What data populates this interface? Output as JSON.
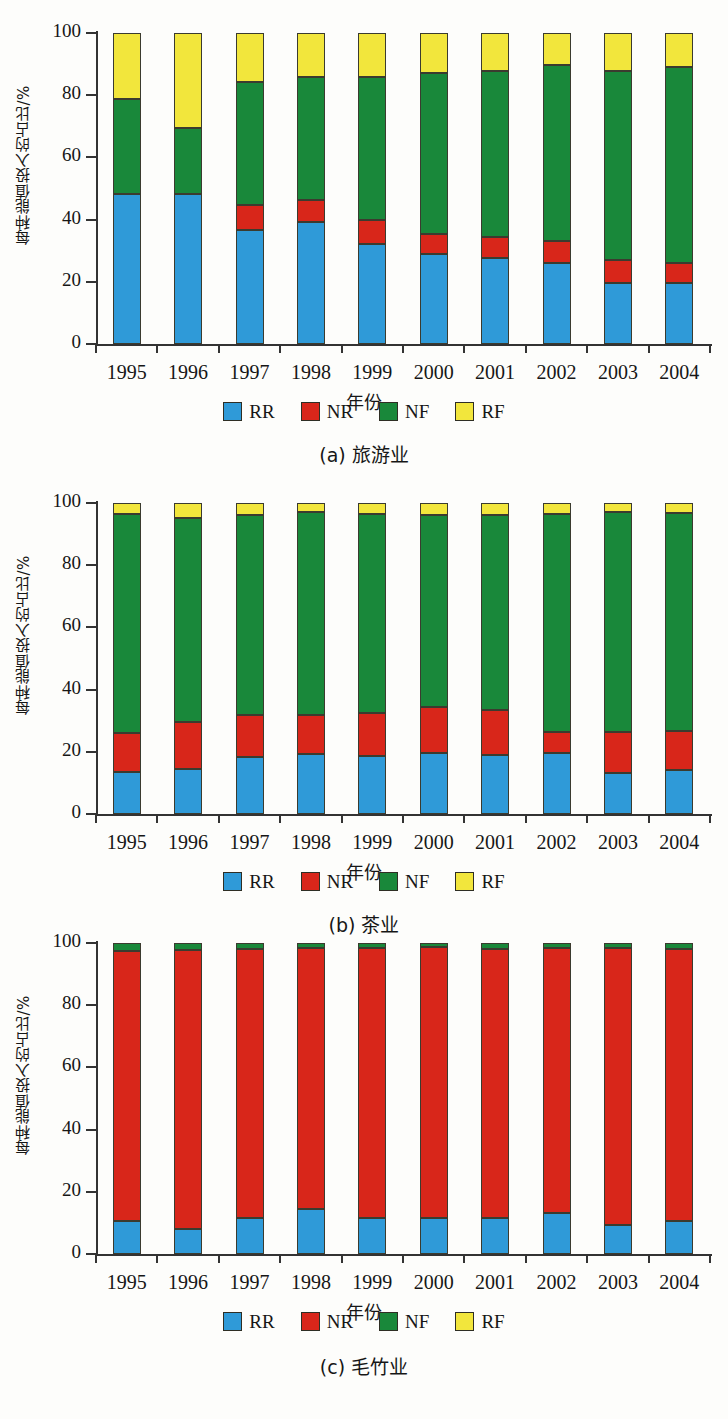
{
  "figure": {
    "y_axis_label": "每种能值投入的占比/%",
    "x_axis_label": "年份",
    "y_ticks": [
      "0",
      "20",
      "40",
      "60",
      "80",
      "100"
    ],
    "years": [
      "1995",
      "1996",
      "1997",
      "1998",
      "1999",
      "2000",
      "2001",
      "2002",
      "2003",
      "2004"
    ],
    "legend": [
      {
        "label": "RR",
        "color": "#2f9ad8",
        "icon": "blue-square-swatch"
      },
      {
        "label": "NR",
        "color": "#d8261a",
        "icon": "red-square-swatch"
      },
      {
        "label": "NF",
        "color": "#19883a",
        "icon": "green-square-swatch"
      },
      {
        "label": "RF",
        "color": "#f2e63c",
        "icon": "yellow-square-swatch"
      }
    ],
    "captions": {
      "a": "(a) 旅游业",
      "b": "(b) 茶业",
      "c": "(c) 毛竹业"
    }
  },
  "chart_data": [
    {
      "id": "a",
      "type": "bar",
      "stacked": true,
      "title": "(a) 旅游业",
      "xlabel": "年份",
      "ylabel": "每种能值投入的占比/%",
      "ylim": [
        0,
        100
      ],
      "yticks": [
        0,
        20,
        40,
        60,
        80,
        100
      ],
      "grid": false,
      "legend_position": "below-axes",
      "categories": [
        "1995",
        "1996",
        "1997",
        "1998",
        "1999",
        "2000",
        "2001",
        "2002",
        "2003",
        "2004"
      ],
      "series": [
        {
          "name": "RR",
          "color": "#2f9ad8",
          "values": [
            48.3,
            48.3,
            36.8,
            39.2,
            32.2,
            28.9,
            27.7,
            26.2,
            19.5,
            19.5
          ]
        },
        {
          "name": "NR",
          "color": "#d8261a",
          "values": [
            0.0,
            0.0,
            7.8,
            7.1,
            7.6,
            6.5,
            6.6,
            6.9,
            7.6,
            6.4
          ]
        },
        {
          "name": "NF",
          "color": "#19883a",
          "values": [
            30.6,
            21.2,
            39.5,
            39.7,
            46.1,
            51.9,
            53.5,
            56.6,
            60.8,
            63.1
          ]
        },
        {
          "name": "RF",
          "color": "#f2e63c",
          "values": [
            21.1,
            30.5,
            15.9,
            14.0,
            14.1,
            12.7,
            12.2,
            10.3,
            12.1,
            11.0
          ]
        }
      ]
    },
    {
      "id": "b",
      "type": "bar",
      "stacked": true,
      "title": "(b) 茶业",
      "xlabel": "年份",
      "ylabel": "每种能值投入的占比/%",
      "ylim": [
        0,
        100
      ],
      "yticks": [
        0,
        20,
        40,
        60,
        80,
        100
      ],
      "grid": false,
      "legend_position": "below-axes",
      "categories": [
        "1995",
        "1996",
        "1997",
        "1998",
        "1999",
        "2000",
        "2001",
        "2002",
        "2003",
        "2004"
      ],
      "series": [
        {
          "name": "RR",
          "color": "#2f9ad8",
          "values": [
            13.4,
            14.5,
            18.4,
            19.4,
            18.6,
            19.5,
            19.1,
            19.5,
            13.3,
            14.0
          ]
        },
        {
          "name": "NR",
          "color": "#d8261a",
          "values": [
            12.6,
            15.2,
            13.4,
            12.3,
            13.9,
            15.0,
            14.4,
            7.0,
            13.1,
            12.7
          ]
        },
        {
          "name": "NF",
          "color": "#19883a",
          "values": [
            70.6,
            65.6,
            64.4,
            65.5,
            64.0,
            61.8,
            62.6,
            70.1,
            70.6,
            70.2
          ]
        },
        {
          "name": "RF",
          "color": "#f2e63c",
          "values": [
            3.4,
            4.7,
            3.8,
            2.8,
            3.5,
            3.7,
            3.9,
            3.4,
            3.0,
            3.1
          ]
        }
      ]
    },
    {
      "id": "c",
      "type": "bar",
      "stacked": true,
      "title": "(c) 毛竹业",
      "xlabel": "年份",
      "ylabel": "每种能值投入的占比/%",
      "ylim": [
        0,
        100
      ],
      "yticks": [
        0,
        20,
        40,
        60,
        80,
        100
      ],
      "grid": false,
      "legend_position": "below-axes",
      "categories": [
        "1995",
        "1996",
        "1997",
        "1998",
        "1999",
        "2000",
        "2001",
        "2002",
        "2003",
        "2004"
      ],
      "series": [
        {
          "name": "RR",
          "color": "#2f9ad8",
          "values": [
            10.5,
            8.0,
            11.6,
            14.5,
            11.6,
            11.6,
            11.6,
            13.2,
            9.4,
            10.6
          ]
        },
        {
          "name": "NR",
          "color": "#d8261a",
          "values": [
            87.0,
            89.7,
            86.5,
            84.0,
            86.8,
            87.0,
            86.6,
            85.2,
            89.1,
            87.4
          ]
        },
        {
          "name": "NF",
          "color": "#19883a",
          "values": [
            2.5,
            2.3,
            1.9,
            1.5,
            1.6,
            1.4,
            1.8,
            1.6,
            1.5,
            2.0
          ]
        },
        {
          "name": "RF",
          "color": "#f2e63c",
          "values": [
            0.0,
            0.0,
            0.0,
            0.0,
            0.0,
            0.0,
            0.0,
            0.0,
            0.0,
            0.0
          ]
        }
      ]
    }
  ]
}
